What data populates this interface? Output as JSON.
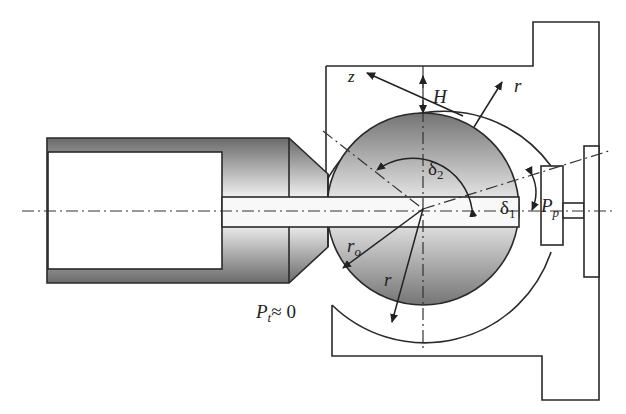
{
  "diagram": {
    "type": "engineering cross-section",
    "labels": {
      "z": "z",
      "H": "H",
      "r_top": "r",
      "delta2": "δ",
      "delta2_sub": "2",
      "delta1": "δ",
      "delta1_sub": "1",
      "Pp": "P",
      "Pp_sub": "p",
      "r0": "r",
      "r0_sub": "o",
      "r_bottom": "r",
      "Pt": "P",
      "Pt_sub": "t",
      "Pt_value": "≈ 0"
    },
    "colors": {
      "line": "#2a2a2a",
      "shade_dark": "#6e6e6e",
      "shade_light": "#f2f2f2",
      "background": "#ffffff"
    }
  }
}
